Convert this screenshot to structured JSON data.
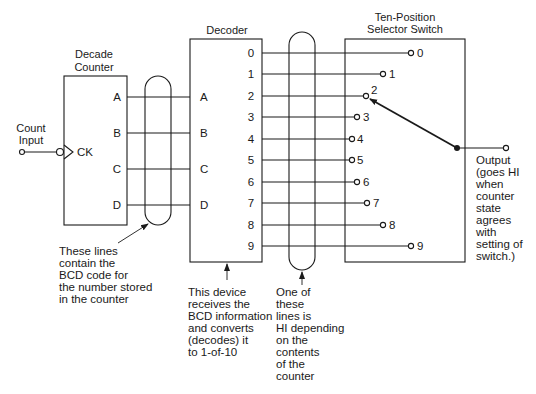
{
  "counter": {
    "title_line1": "Decade",
    "title_line2": "Counter",
    "clock_label": "CK",
    "outputs": [
      "A",
      "B",
      "C",
      "D"
    ]
  },
  "count_input": {
    "line1": "Count",
    "line2": "Input"
  },
  "decoder": {
    "title": "Decoder",
    "inputs": [
      "A",
      "B",
      "C",
      "D"
    ],
    "outputs": [
      "0",
      "1",
      "2",
      "3",
      "4",
      "5",
      "6",
      "7",
      "8",
      "9"
    ]
  },
  "switch": {
    "title_line1": "Ten-Position",
    "title_line2": "Selector Switch",
    "positions": [
      "0",
      "1",
      "2",
      "3",
      "4",
      "5",
      "6",
      "7",
      "8",
      "9"
    ],
    "selected_position": "2"
  },
  "output_note": {
    "lines": [
      "Output",
      "(goes HI",
      "when",
      "counter",
      "state",
      "agrees",
      "with",
      "setting of",
      "switch.)"
    ]
  },
  "annotations": {
    "bcd_lines": [
      "These lines",
      "contain the",
      "BCD code for",
      "the number stored",
      "in the counter"
    ],
    "decoder_device": [
      "This device",
      "receives the",
      "BCD information",
      "and converts",
      "(decodes) it",
      "to 1-of-10"
    ],
    "one_of_lines": [
      "One of",
      "these",
      "lines is",
      "HI depending",
      "on the",
      "contents",
      "of the",
      "counter"
    ]
  }
}
